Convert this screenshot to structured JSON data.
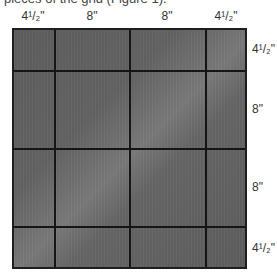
{
  "caption_fragment": "pieces of the grid (Figure 1).",
  "diagram": {
    "fill_color": "#646464",
    "line_color": "#1a1a1a",
    "columns": [
      {
        "label_whole": "4",
        "label_frac": "1/2",
        "unit": "\"",
        "size_in": 4.5
      },
      {
        "label_whole": "8",
        "label_frac": "",
        "unit": "\"",
        "size_in": 8
      },
      {
        "label_whole": "8",
        "label_frac": "",
        "unit": "\"",
        "size_in": 8
      },
      {
        "label_whole": "4",
        "label_frac": "1/2",
        "unit": "\"",
        "size_in": 4.5
      }
    ],
    "rows": [
      {
        "label_whole": "4",
        "label_frac": "1/2",
        "unit": "\"",
        "size_in": 4.5
      },
      {
        "label_whole": "8",
        "label_frac": "",
        "unit": "\"",
        "size_in": 8
      },
      {
        "label_whole": "8",
        "label_frac": "",
        "unit": "\"",
        "size_in": 8
      },
      {
        "label_whole": "4",
        "label_frac": "1/2",
        "unit": "\"",
        "size_in": 4.5
      }
    ],
    "col_labels": [
      "4¹/₂\"",
      "8\"",
      "8\"",
      "4¹/₂\""
    ],
    "row_labels": [
      "4¹/₂\"",
      "8\"",
      "8\"",
      "4¹/₂\""
    ]
  }
}
